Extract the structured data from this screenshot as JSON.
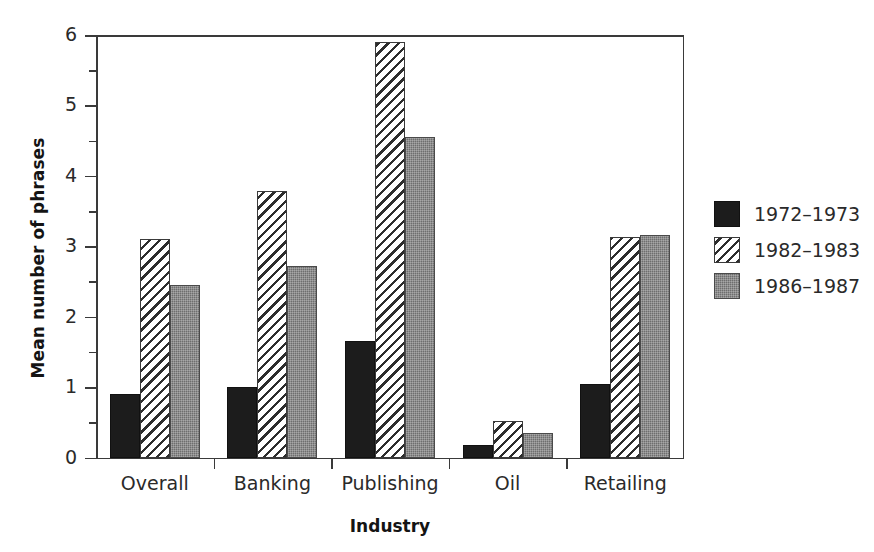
{
  "chart_data": {
    "type": "bar",
    "title": "",
    "xlabel": "Industry",
    "ylabel": "Mean number of phrases",
    "categories": [
      "Overall",
      "Banking",
      "Publishing",
      "Oil",
      "Retailing"
    ],
    "series": [
      {
        "name": "1972–1973",
        "color": "#1c1c1c",
        "fill": "solid-black",
        "values": [
          0.9,
          1.0,
          1.65,
          0.18,
          1.05
        ]
      },
      {
        "name": "1982–1983",
        "color": "#ffffff",
        "fill": "diagonal-hatch",
        "values": [
          3.1,
          3.78,
          5.9,
          0.52,
          3.13
        ]
      },
      {
        "name": "1986–1987",
        "color": "#6e6e6e",
        "fill": "gray-stipple",
        "values": [
          2.45,
          2.72,
          4.55,
          0.35,
          3.16
        ]
      }
    ],
    "ylim": [
      0,
      6
    ],
    "ytick_labels": [
      "0",
      "1",
      "2",
      "3",
      "4",
      "5",
      "6"
    ],
    "ytick_values": [
      0,
      1,
      2,
      3,
      4,
      5,
      6
    ],
    "yminor_values": [
      0.5,
      1.5,
      2.5,
      3.5,
      4.5,
      5.5
    ],
    "grid": false,
    "legend_position": "right",
    "legend_entries": [
      "1972–1973",
      "1982–1983",
      "1986–1987"
    ]
  },
  "axis": {
    "y_title": "Mean number of phrases",
    "x_title": "Industry",
    "y_labels": [
      "6",
      "5",
      "4",
      "3",
      "2",
      "1",
      "0"
    ]
  },
  "legend": {
    "items": [
      {
        "label": "1972–1973"
      },
      {
        "label": "1982–1983"
      },
      {
        "label": "1986–1987"
      }
    ]
  }
}
